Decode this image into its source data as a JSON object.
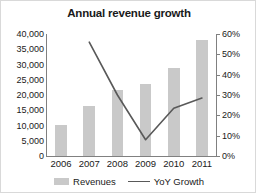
{
  "chart_data": {
    "type": "bar",
    "title": "Annual revenue growth",
    "xlabel": "",
    "ylabel": "",
    "categories": [
      "2006",
      "2007",
      "2008",
      "2009",
      "2010",
      "2011"
    ],
    "grid": false,
    "legend_position": "bottom",
    "series": [
      {
        "name": "Revenues",
        "type": "bar",
        "axis": "left",
        "color": "#c9c9c9",
        "values": [
          10300,
          16500,
          21500,
          23500,
          29000,
          38000
        ]
      },
      {
        "name": "YoY Growth",
        "type": "line",
        "axis": "right",
        "color": "#595959",
        "values": [
          null,
          0.56,
          0.3,
          0.08,
          0.235,
          0.285
        ]
      }
    ],
    "left_axis": {
      "ylim": [
        0,
        40000
      ],
      "tick_values": [
        0,
        5000,
        10000,
        15000,
        20000,
        25000,
        30000,
        35000,
        40000
      ],
      "tick_labels": [
        "0",
        "5,000",
        "10,000",
        "15,000",
        "20,000",
        "25,000",
        "30,000",
        "35,000",
        "40,000"
      ]
    },
    "right_axis": {
      "ylim": [
        0,
        0.6
      ],
      "tick_values": [
        0,
        0.1,
        0.2,
        0.3,
        0.4,
        0.5,
        0.6
      ],
      "tick_labels": [
        "0%",
        "10%",
        "20%",
        "30%",
        "40%",
        "50%",
        "60%"
      ]
    }
  },
  "legend": {
    "revenues_label": "Revenues",
    "growth_label": "YoY Growth"
  },
  "colors": {
    "bar": "#c9c9c9",
    "line": "#595959",
    "axis": "#808080",
    "text": "#1a1a1a"
  }
}
